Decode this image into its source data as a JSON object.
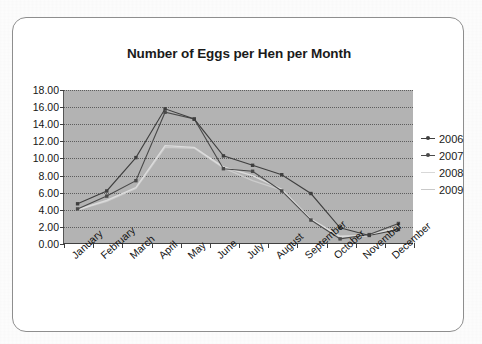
{
  "card": {
    "title": "Number of Eggs per Hen per Month"
  },
  "legend": {
    "position": "right",
    "entries": [
      {
        "label": "2006",
        "color": "#3f3f3f",
        "marker": "diamond"
      },
      {
        "label": "2007",
        "color": "#4a4a4a",
        "marker": "square"
      },
      {
        "label": "2008",
        "color": "#d8d8d8",
        "marker": "none"
      },
      {
        "label": "2009",
        "color": "#c9c9c9",
        "marker": "none"
      }
    ]
  },
  "chart_data": {
    "type": "line",
    "title": "Number of Eggs per Hen per Month",
    "xlabel": "",
    "ylabel": "",
    "ylim": [
      0,
      18
    ],
    "ytick_step": 2,
    "ytick_labels": [
      "0.00",
      "2.00",
      "4.00",
      "6.00",
      "8.00",
      "10.00",
      "12.00",
      "14.00",
      "16.00",
      "18.00"
    ],
    "grid": true,
    "plot_background": "#b3b3b3",
    "categories": [
      "January",
      "February",
      "March",
      "April",
      "May",
      "June",
      "July",
      "August",
      "September",
      "October",
      "November",
      "December"
    ],
    "series": [
      {
        "name": "2006",
        "color": "#3f3f3f",
        "values": [
          4.7,
          6.2,
          10.1,
          15.8,
          14.6,
          10.3,
          9.2,
          8.1,
          5.9,
          1.9,
          1.0,
          1.7
        ]
      },
      {
        "name": "2007",
        "color": "#4a4a4a",
        "values": [
          4.1,
          5.6,
          7.4,
          15.4,
          14.6,
          8.8,
          8.5,
          6.2,
          2.8,
          0.6,
          1.1,
          2.4
        ]
      },
      {
        "name": "2008",
        "color": "#dcdcdc",
        "values": [
          4.0,
          5.1,
          6.6,
          11.5,
          11.3,
          9.0,
          8.0,
          6.4,
          2.9,
          0.9,
          1.0,
          2.0
        ]
      },
      {
        "name": "2009",
        "color": "#cccccc",
        "values": [
          4.0,
          5.0,
          6.5,
          11.3,
          11.2,
          8.9,
          7.4,
          6.3,
          2.8,
          0.8,
          1.0,
          1.9
        ]
      }
    ]
  }
}
